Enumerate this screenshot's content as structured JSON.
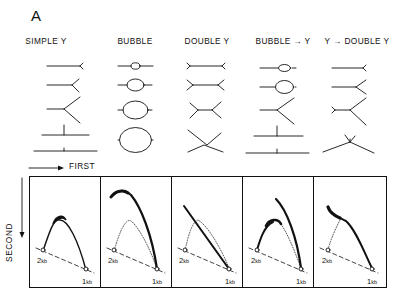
{
  "figure": {
    "panel_label": "A",
    "columns": [
      {
        "label": "SIMPLE Y",
        "center_x": 46
      },
      {
        "label": "BUBBLE",
        "center_x": 135
      },
      {
        "label": "DOUBLE Y",
        "center_x": 207
      },
      {
        "label": "BUBBLE → Y",
        "center_x": 283
      },
      {
        "label": "Y → DOUBLE Y",
        "center_x": 357
      }
    ],
    "axes": {
      "first_label": "FIRST",
      "second_label": "SECOND"
    },
    "markers": {
      "left_marker": "2",
      "left_unit": "kb",
      "right_marker": "1",
      "right_unit": "kb"
    },
    "style": {
      "ink": "#111111",
      "background": "#ffffff"
    }
  }
}
